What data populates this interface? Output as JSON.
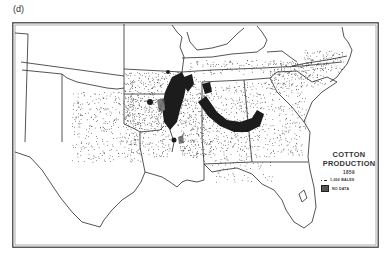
{
  "panel_label": "(d)",
  "map": {
    "title_line1": "COTTON",
    "title_line2": "PRODUCTION",
    "year": "1859",
    "legend": [
      {
        "symbol": "dot",
        "label": "1,000 BALES"
      },
      {
        "symbol": "shaded-square",
        "label": "NO DATA"
      }
    ],
    "type": "dot-density",
    "region": "Southern United States",
    "colors": {
      "ink": "#222222",
      "no_data": "#7a7a7a",
      "background": "#ffffff"
    }
  }
}
